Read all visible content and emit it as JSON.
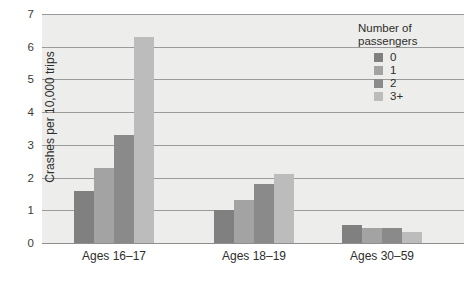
{
  "chart_data": {
    "type": "bar",
    "title": "",
    "xlabel": "",
    "ylabel": "Crashes per 10,000 trips",
    "categories": [
      "Ages 16–17",
      "Ages 18–19",
      "Ages 30–59"
    ],
    "series": [
      {
        "name": "0",
        "color": "#808080",
        "values": [
          1.6,
          1.0,
          0.55
        ]
      },
      {
        "name": "1",
        "color": "#a3a3a3",
        "values": [
          2.3,
          1.3,
          0.45
        ]
      },
      {
        "name": "2",
        "color": "#8a8a8a",
        "values": [
          3.3,
          1.8,
          0.45
        ]
      },
      {
        "name": "3+",
        "color": "#bcbcbc",
        "values": [
          6.3,
          2.1,
          0.35
        ]
      }
    ],
    "ylim": [
      0,
      7
    ],
    "yticks": [
      0,
      1,
      2,
      3,
      4,
      5,
      6,
      7
    ],
    "ytick_labels": [
      "0",
      "1",
      "2",
      "3",
      "4",
      "5",
      "6",
      "7"
    ],
    "grid": true,
    "legend": {
      "position": "top-right",
      "title_lines": [
        "Number of",
        "passengers"
      ],
      "entries": [
        {
          "label": "0",
          "color": "#808080"
        },
        {
          "label": "1",
          "color": "#a3a3a3"
        },
        {
          "label": "2",
          "color": "#8a8a8a"
        },
        {
          "label": "3+",
          "color": "#bcbcbc"
        }
      ]
    },
    "plot_background": "#ededeb",
    "gridline_color": "#9a9a98",
    "page_background": "#ffffff"
  }
}
